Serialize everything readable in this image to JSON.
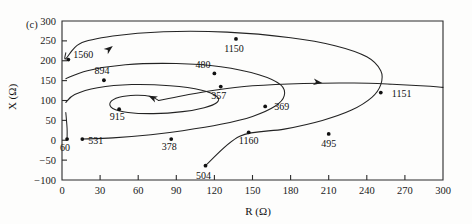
{
  "figure": {
    "panel_label": "(c)",
    "xlabel": "R (Ω)",
    "ylabel": "X (Ω)"
  },
  "chart_data": {
    "type": "line",
    "title": "",
    "subtitle": "",
    "panel": "(c)",
    "xlabel": "R (Ω)",
    "ylabel": "X (Ω)",
    "xlim": [
      0,
      300
    ],
    "ylim": [
      -100,
      300
    ],
    "xticks": [
      0,
      30,
      60,
      90,
      120,
      150,
      180,
      210,
      240,
      270,
      300
    ],
    "yticks": [
      -100,
      -50,
      0,
      50,
      100,
      150,
      200,
      250,
      300
    ],
    "xticklabels": [
      "0",
      "30",
      "60",
      "90",
      "120",
      "150",
      "180",
      "210",
      "240",
      "270",
      "300"
    ],
    "yticklabels": [
      "-100",
      "-50",
      "0",
      "50",
      "100",
      "150",
      "200",
      "250",
      "300"
    ],
    "grid": false,
    "legend": null,
    "annotations": [
      {
        "label": "1560",
        "x": 5,
        "y": 203
      },
      {
        "label": "894",
        "x": 33,
        "y": 151
      },
      {
        "label": "915",
        "x": 45,
        "y": 78
      },
      {
        "label": "531",
        "x": 16,
        "y": 3
      },
      {
        "label": "60",
        "x": 4,
        "y": 3
      },
      {
        "label": "378",
        "x": 86,
        "y": 3
      },
      {
        "label": "504",
        "x": 113,
        "y": -64
      },
      {
        "label": "357",
        "x": 125,
        "y": 135
      },
      {
        "label": "1150",
        "x": 137,
        "y": 255
      },
      {
        "label": "480",
        "x": 120,
        "y": 168
      },
      {
        "label": "369",
        "x": 160,
        "y": 85
      },
      {
        "label": "1160",
        "x": 147,
        "y": 20
      },
      {
        "label": "495",
        "x": 210,
        "y": 16
      },
      {
        "label": "1151",
        "x": 251,
        "y": 120
      }
    ],
    "series": [
      {
        "name": "spiral-outer",
        "comment": "outermost loop through 1560, 1150, 1151, 495, 504",
        "points": [
          [
            3,
            220
          ],
          [
            3,
            205
          ],
          [
            14,
            243
          ],
          [
            40,
            262
          ],
          [
            80,
            273
          ],
          [
            130,
            272
          ],
          [
            180,
            258
          ],
          [
            215,
            238
          ],
          [
            240,
            210
          ],
          [
            251,
            175
          ],
          [
            251,
            140
          ],
          [
            244,
            108
          ],
          [
            228,
            76
          ],
          [
            205,
            50
          ],
          [
            175,
            28
          ],
          [
            140,
            10
          ],
          [
            113,
            -64
          ]
        ]
      },
      {
        "name": "spiral-middle",
        "comment": "middle loop through 894, 480, 369, 1160, 378",
        "points": [
          [
            3,
            155
          ],
          [
            20,
            175
          ],
          [
            50,
            190
          ],
          [
            90,
            193
          ],
          [
            125,
            185
          ],
          [
            155,
            165
          ],
          [
            172,
            140
          ],
          [
            175,
            112
          ],
          [
            168,
            86
          ],
          [
            150,
            60
          ],
          [
            125,
            40
          ],
          [
            95,
            24
          ],
          [
            70,
            14
          ],
          [
            40,
            6
          ],
          [
            16,
            3
          ]
        ]
      },
      {
        "name": "spiral-inner",
        "comment": "inner loop through 915, 357 toward the focus",
        "points": [
          [
            3,
            95
          ],
          [
            10,
            115
          ],
          [
            28,
            132
          ],
          [
            55,
            140
          ],
          [
            85,
            137
          ],
          [
            110,
            126
          ],
          [
            122,
            110
          ],
          [
            122,
            95
          ],
          [
            112,
            82
          ],
          [
            95,
            72
          ],
          [
            72,
            67
          ],
          [
            52,
            70
          ],
          [
            40,
            80
          ],
          [
            38,
            95
          ],
          [
            45,
            108
          ],
          [
            58,
            113
          ],
          [
            70,
            110
          ],
          [
            76,
            100
          ]
        ]
      },
      {
        "name": "spiral-tail",
        "comment": "long tail leaving to the right from the inner whorl",
        "points": [
          [
            76,
            100
          ],
          [
            95,
            112
          ],
          [
            120,
            126
          ],
          [
            150,
            137
          ],
          [
            190,
            143
          ],
          [
            230,
            144
          ],
          [
            260,
            141
          ],
          [
            290,
            136
          ],
          [
            300,
            133
          ]
        ]
      },
      {
        "name": "leader-60",
        "comment": "short branch near the origin",
        "points": [
          [
            3,
            70
          ],
          [
            4,
            30
          ],
          [
            4,
            3
          ]
        ]
      }
    ],
    "arrows": [
      {
        "name": "arrow-outer",
        "x": 40,
        "y": 237,
        "angle": -38
      },
      {
        "name": "arrow-inner",
        "x": 68,
        "y": 112,
        "angle": 205
      },
      {
        "name": "arrow-tail",
        "x": 205,
        "y": 144,
        "angle": 8
      }
    ]
  }
}
